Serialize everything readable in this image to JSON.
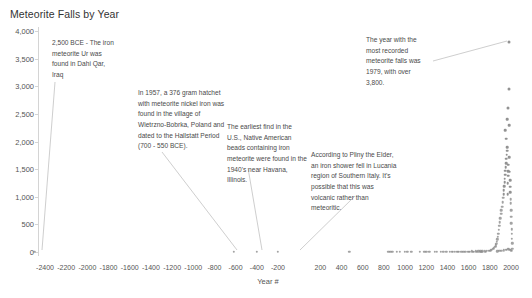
{
  "chart_data": {
    "type": "scatter",
    "title": "Meteorite Falls by Year",
    "xlabel": "Year #",
    "ylabel": "",
    "xlim": [
      -2500,
      2050
    ],
    "ylim": [
      0,
      4000
    ],
    "grid": false,
    "legend": "none",
    "x_ticks": [
      -2400,
      -2200,
      -2000,
      -1800,
      -1600,
      -1400,
      -1200,
      -1000,
      -800,
      -600,
      -400,
      -200,
      200,
      400,
      600,
      800,
      1000,
      1200,
      1400,
      1600,
      1800,
      2000
    ],
    "x_tick_labels": [
      "-2400",
      "-2200",
      "-2000",
      "-1800",
      "-1600",
      "-1400",
      "-1200",
      "-1000",
      "-800",
      "-600",
      "-400",
      "-200",
      "200",
      "400",
      "600",
      "800",
      "1000",
      "1200",
      "1400",
      "1600",
      "1800",
      "2000"
    ],
    "y_ticks": [
      0,
      500,
      1000,
      1500,
      2000,
      2500,
      3000,
      3500,
      4000
    ],
    "y_tick_labels": [
      "0",
      "500",
      "1,000",
      "1,500",
      "2,000",
      "2,500",
      "3,000",
      "3,500",
      "4,000"
    ],
    "point_color": "#8c8c8c",
    "points": [
      {
        "x": -2500,
        "y": 1
      },
      {
        "x": -620,
        "y": 1
      },
      {
        "x": -400,
        "y": 1
      },
      {
        "x": -200,
        "y": 1
      },
      {
        "x": 475,
        "y": 1
      },
      {
        "x": 860,
        "y": 2
      },
      {
        "x": 920,
        "y": 2
      },
      {
        "x": 950,
        "y": 2
      },
      {
        "x": 1000,
        "y": 2
      },
      {
        "x": 1060,
        "y": 3
      },
      {
        "x": 1180,
        "y": 2
      },
      {
        "x": 1200,
        "y": 3
      },
      {
        "x": 1230,
        "y": 2
      },
      {
        "x": 1300,
        "y": 3
      },
      {
        "x": 1360,
        "y": 4
      },
      {
        "x": 1390,
        "y": 3
      },
      {
        "x": 1420,
        "y": 5
      },
      {
        "x": 1450,
        "y": 4
      },
      {
        "x": 1470,
        "y": 6
      },
      {
        "x": 1490,
        "y": 5
      },
      {
        "x": 1510,
        "y": 7
      },
      {
        "x": 1530,
        "y": 6
      },
      {
        "x": 1550,
        "y": 8
      },
      {
        "x": 1570,
        "y": 7
      },
      {
        "x": 1590,
        "y": 9
      },
      {
        "x": 1610,
        "y": 8
      },
      {
        "x": 1630,
        "y": 10
      },
      {
        "x": 1650,
        "y": 9
      },
      {
        "x": 1670,
        "y": 12
      },
      {
        "x": 1690,
        "y": 11
      },
      {
        "x": 1710,
        "y": 14
      },
      {
        "x": 1730,
        "y": 13
      },
      {
        "x": 1750,
        "y": 16
      },
      {
        "x": 1770,
        "y": 18
      },
      {
        "x": 1790,
        "y": 22
      },
      {
        "x": 1800,
        "y": 26
      },
      {
        "x": 1810,
        "y": 30
      },
      {
        "x": 1820,
        "y": 40
      },
      {
        "x": 1830,
        "y": 55
      },
      {
        "x": 1840,
        "y": 70
      },
      {
        "x": 1850,
        "y": 95
      },
      {
        "x": 1855,
        "y": 120
      },
      {
        "x": 1860,
        "y": 150
      },
      {
        "x": 1865,
        "y": 190
      },
      {
        "x": 1870,
        "y": 230
      },
      {
        "x": 1875,
        "y": 280
      },
      {
        "x": 1880,
        "y": 330
      },
      {
        "x": 1885,
        "y": 400
      },
      {
        "x": 1890,
        "y": 470
      },
      {
        "x": 1895,
        "y": 540
      },
      {
        "x": 1900,
        "y": 610
      },
      {
        "x": 1905,
        "y": 690
      },
      {
        "x": 1910,
        "y": 760
      },
      {
        "x": 1915,
        "y": 820
      },
      {
        "x": 1920,
        "y": 900
      },
      {
        "x": 1925,
        "y": 980
      },
      {
        "x": 1930,
        "y": 1050
      },
      {
        "x": 1933,
        "y": 1120
      },
      {
        "x": 1936,
        "y": 1190
      },
      {
        "x": 1939,
        "y": 1260
      },
      {
        "x": 1942,
        "y": 1330
      },
      {
        "x": 1945,
        "y": 1400
      },
      {
        "x": 1948,
        "y": 1470
      },
      {
        "x": 1950,
        "y": 1540
      },
      {
        "x": 1953,
        "y": 1610
      },
      {
        "x": 1956,
        "y": 1690
      },
      {
        "x": 1959,
        "y": 1760
      },
      {
        "x": 1962,
        "y": 1830
      },
      {
        "x": 1965,
        "y": 1900
      },
      {
        "x": 1968,
        "y": 1050
      },
      {
        "x": 1970,
        "y": 1240
      },
      {
        "x": 1972,
        "y": 1380
      },
      {
        "x": 1974,
        "y": 1460
      },
      {
        "x": 1976,
        "y": 1580
      },
      {
        "x": 1979,
        "y": 3800
      },
      {
        "x": 1982,
        "y": 2950
      },
      {
        "x": 1985,
        "y": 1720
      },
      {
        "x": 1988,
        "y": 1450
      },
      {
        "x": 1990,
        "y": 1300
      },
      {
        "x": 1992,
        "y": 1180
      },
      {
        "x": 1994,
        "y": 1080
      },
      {
        "x": 1996,
        "y": 960
      },
      {
        "x": 1998,
        "y": 880
      },
      {
        "x": 2000,
        "y": 760
      },
      {
        "x": 2002,
        "y": 640
      },
      {
        "x": 2004,
        "y": 520
      },
      {
        "x": 2006,
        "y": 410
      },
      {
        "x": 2008,
        "y": 330
      },
      {
        "x": 2010,
        "y": 240
      },
      {
        "x": 2012,
        "y": 160
      },
      {
        "x": 2013,
        "y": 60
      },
      {
        "x": 1870,
        "y": 15
      },
      {
        "x": 1890,
        "y": 18
      },
      {
        "x": 1910,
        "y": 22
      },
      {
        "x": 1930,
        "y": 28
      },
      {
        "x": 1950,
        "y": 35
      },
      {
        "x": 1960,
        "y": 45
      },
      {
        "x": 1970,
        "y": 55
      },
      {
        "x": 1980,
        "y": 48
      },
      {
        "x": 1990,
        "y": 40
      },
      {
        "x": 2000,
        "y": 30
      },
      {
        "x": 2010,
        "y": 20
      },
      {
        "x": 1600,
        "y": 2
      },
      {
        "x": 1640,
        "y": 2
      },
      {
        "x": 1680,
        "y": 3
      },
      {
        "x": 1720,
        "y": 3
      },
      {
        "x": 1760,
        "y": 4
      },
      {
        "x": 1500,
        "y": 2
      },
      {
        "x": 1440,
        "y": 2
      },
      {
        "x": 1340,
        "y": 2
      },
      {
        "x": 1280,
        "y": 2
      },
      {
        "x": 1140,
        "y": 2
      },
      {
        "x": 1020,
        "y": 2
      },
      {
        "x": 880,
        "y": 2
      },
      {
        "x": 840,
        "y": 2
      },
      {
        "x": 1945,
        "y": 2200
      },
      {
        "x": 1955,
        "y": 2050
      },
      {
        "x": 1965,
        "y": 2400
      },
      {
        "x": 1975,
        "y": 2600
      },
      {
        "x": 1985,
        "y": 2300
      }
    ]
  },
  "annotations": [
    {
      "id": "ur-meteorite",
      "text": "2,500 BCE - The iron meteorite Ur was found in Dahi Qar, Iraq",
      "left": 52,
      "top": 38,
      "width": 62,
      "line": {
        "x1": 55,
        "y1": 82,
        "x2": 42,
        "y2": 250
      }
    },
    {
      "id": "wietrzno-bobrka-hatchet",
      "text": "In 1957, a 376 gram hatchet with meteorite nickel iron was found in the village of Wietrzno-Bobrka, Poland and dated to the Hallstatt Period (700 - 550 BCE).",
      "left": 138,
      "top": 88,
      "width": 92,
      "line": {
        "x1": 162,
        "y1": 152,
        "x2": 237,
        "y2": 250
      }
    },
    {
      "id": "havana-illinois-beads",
      "text": "The earliest find in the U.S., Native American beads containing iron meteorite were found in the 1940's near Havana, Illinois.",
      "left": 227,
      "top": 122,
      "width": 80,
      "line": {
        "x1": 248,
        "y1": 168,
        "x2": 262,
        "y2": 250
      }
    },
    {
      "id": "pliny-lucania-shower",
      "text": "According to Pliny the Elder, an iron shower fell in Lucania region of Southern Italy. It's possible that this was volcanic rather than meteoritic.",
      "left": 311,
      "top": 150,
      "width": 86,
      "line": {
        "x1": 355,
        "y1": 196,
        "x2": 300,
        "y2": 250
      }
    },
    {
      "id": "peak-year-1979",
      "text": "The year with the most recorded meteorite falls was 1979, with over 3,800.",
      "left": 366,
      "top": 35,
      "width": 62,
      "line": {
        "x1": 433,
        "y1": 61,
        "x2": 507,
        "y2": 41
      }
    }
  ]
}
